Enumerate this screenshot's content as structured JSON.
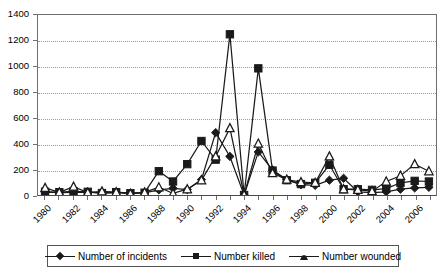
{
  "chart_data": {
    "type": "line",
    "title": "",
    "xlabel": "",
    "ylabel": "",
    "ylim": [
      0,
      1400
    ],
    "ytick_step": 200,
    "yticks": [
      0,
      200,
      400,
      600,
      800,
      1000,
      1200,
      1400
    ],
    "grid": true,
    "legend_position": "bottom",
    "x": [
      1980,
      1981,
      1982,
      1983,
      1984,
      1985,
      1986,
      1987,
      1988,
      1989,
      1990,
      1991,
      1992,
      1993,
      1994,
      1995,
      1996,
      1997,
      1998,
      1999,
      2000,
      2001,
      2002,
      2003,
      2004,
      2005,
      2006,
      2007
    ],
    "xtick_labels": [
      "1980",
      "1982",
      "1984",
      "1986",
      "1988",
      "1990",
      "1992",
      "1994",
      "1996",
      "1998",
      "2000",
      "2002",
      "2004",
      "2006"
    ],
    "xtick_label_step": 2,
    "series": [
      {
        "name": "Number of incidents",
        "marker": "filled-diamond",
        "color": "#1a1a1a",
        "values": [
          22,
          18,
          20,
          22,
          14,
          18,
          12,
          16,
          40,
          52,
          42,
          120,
          485,
          300,
          0,
          335,
          195,
          120,
          80,
          75,
          115,
          130,
          25,
          18,
          25,
          45,
          55,
          60
        ]
      },
      {
        "name": "Number killed",
        "marker": "filled-square",
        "color": "#1a1a1a",
        "values": [
          25,
          22,
          28,
          25,
          15,
          22,
          14,
          18,
          185,
          105,
          240,
          420,
          275,
          1250,
          0,
          985,
          190,
          115,
          85,
          95,
          235,
          45,
          45,
          40,
          50,
          95,
          110,
          105
        ]
      },
      {
        "name": "Number wounded",
        "marker": "open-triangle",
        "color": "#1a1a1a",
        "values": [
          55,
          20,
          65,
          18,
          28,
          22,
          10,
          20,
          60,
          12,
          45,
          115,
          300,
          520,
          0,
          400,
          170,
          120,
          100,
          95,
          300,
          45,
          40,
          30,
          105,
          150,
          240,
          185
        ]
      }
    ]
  },
  "legend": {
    "items": [
      {
        "label": "Number of incidents",
        "marker": "filled-diamond"
      },
      {
        "label": "Number killed",
        "marker": "filled-square"
      },
      {
        "label": "Number wounded",
        "marker": "open-triangle"
      }
    ]
  }
}
